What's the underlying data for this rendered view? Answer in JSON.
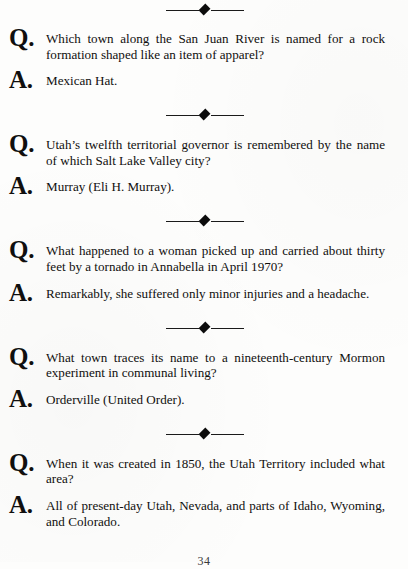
{
  "page": {
    "page_number": "34",
    "question_marker": "Q.",
    "answer_marker": "A.",
    "divider_icon": "diamond-ornament"
  },
  "entries": [
    {
      "question": "Which town along the San Juan River is named for a rock formation shaped like an item of apparel?",
      "answer": "Mexican Hat."
    },
    {
      "question": "Utah’s twelfth territorial governor is remembered by the name of which Salt Lake Valley city?",
      "answer": "Murray (Eli H. Murray)."
    },
    {
      "question": "What happened to a woman picked up and carried about thirty feet by a tornado in Annabella in April 1970?",
      "answer": "Remarkably, she suffered only minor injuries and a headache."
    },
    {
      "question": "What town traces its name to a nineteenth-century Mormon experiment in communal living?",
      "answer": "Orderville (United Order)."
    },
    {
      "question": "When it was created in 1850, the Utah Territory included what area?",
      "answer": "All of present-day Utah, Nevada, and parts of Idaho, Wyoming, and Colorado."
    }
  ]
}
